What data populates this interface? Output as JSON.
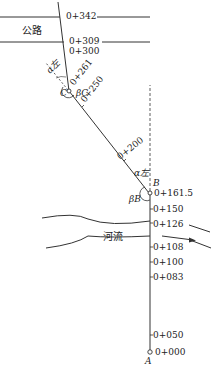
{
  "diagram": {
    "road_label": "公路",
    "river_label": "河流",
    "points": {
      "A": "A",
      "B": "B",
      "C": "C"
    },
    "angles": {
      "alpha_left_C": "α左",
      "beta_C": "βC",
      "alpha_left_B": "α左",
      "beta_B": "βB"
    },
    "stations_segment_AB": [
      "0+000",
      "0+050",
      "0+083",
      "0+100",
      "0+108",
      "0+126",
      "0+150",
      "0+161.5"
    ],
    "stations_segment_BC": [
      "0+200",
      "0+250",
      "0+261"
    ],
    "stations_segment_C_top": [
      "0+300",
      "0+309",
      "0+342"
    ],
    "colors": {
      "line": "#333333",
      "text": "#222222",
      "background": "#ffffff"
    }
  }
}
